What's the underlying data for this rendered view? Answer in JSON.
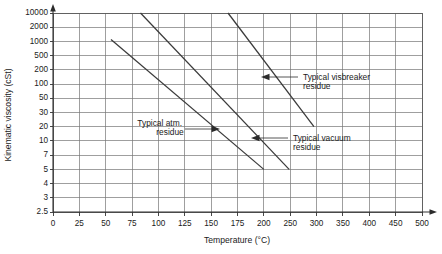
{
  "chart_data": {
    "type": "line",
    "title": "",
    "xlabel": "Temperature (°C)",
    "ylabel": "Kinematic viscosity (cSt)",
    "x_scale": "piecewise-linear",
    "y_scale": "log",
    "xlim": [
      0,
      500
    ],
    "ylim": [
      2.5,
      10000
    ],
    "grid": true,
    "legend_position": "inline-annotations",
    "x_ticks": [
      {
        "value": 0,
        "label": "0"
      },
      {
        "value": 25,
        "label": "25"
      },
      {
        "value": 50,
        "label": "50"
      },
      {
        "value": 75,
        "label": "75"
      },
      {
        "value": 100,
        "label": "100"
      },
      {
        "value": 125,
        "label": "125"
      },
      {
        "value": 150,
        "label": "150"
      },
      {
        "value": 175,
        "label": "175"
      },
      {
        "value": 200,
        "label": "200"
      },
      {
        "value": 250,
        "label": "250"
      },
      {
        "value": 300,
        "label": "300"
      },
      {
        "value": 350,
        "label": "350"
      },
      {
        "value": 400,
        "label": "400"
      },
      {
        "value": 450,
        "label": "450"
      },
      {
        "value": 500,
        "label": "500"
      }
    ],
    "y_ticks": [
      {
        "value": 10000,
        "label": "10000"
      },
      {
        "value": 2000,
        "label": "2000"
      },
      {
        "value": 1000,
        "label": "1000"
      },
      {
        "value": 500,
        "label": "500"
      },
      {
        "value": 200,
        "label": "200"
      },
      {
        "value": 100,
        "label": "100"
      },
      {
        "value": 50,
        "label": "50"
      },
      {
        "value": 30,
        "label": "30"
      },
      {
        "value": 20,
        "label": "20"
      },
      {
        "value": 10,
        "label": "10"
      },
      {
        "value": 7,
        "label": "7"
      },
      {
        "value": 5,
        "label": "5"
      },
      {
        "value": 4,
        "label": "4"
      },
      {
        "value": 3,
        "label": "3"
      },
      {
        "value": 2.5,
        "label": "2.5"
      }
    ],
    "series": [
      {
        "name": "Typical atm. residue",
        "points": [
          [
            55,
            1100
          ],
          [
            200,
            5.0
          ]
        ]
      },
      {
        "name": "Typical vacuum residue",
        "points": [
          [
            83,
            10000
          ],
          [
            248,
            5.0
          ]
        ]
      },
      {
        "name": "Typical visbreaker residue",
        "points": [
          [
            166,
            10000
          ],
          [
            295,
            20
          ]
        ]
      }
    ],
    "annotations": [
      {
        "name": "Typical atm. residue",
        "line1": "Typical atm.",
        "line2": "residue",
        "arrow_direction": "right"
      },
      {
        "name": "Typical visbreaker residue",
        "line1": "Typical visbreaker",
        "line2": "residue",
        "arrow_direction": "left"
      },
      {
        "name": "Typical vacuum residue",
        "line1": "Typical vacuum",
        "line2": "residue",
        "arrow_direction": "left"
      }
    ],
    "colors": {
      "background": "#ffffff",
      "grid": "#767676",
      "data_line": "#3a3a3a",
      "text": "#1a1a1a",
      "axis": "#333333"
    }
  }
}
